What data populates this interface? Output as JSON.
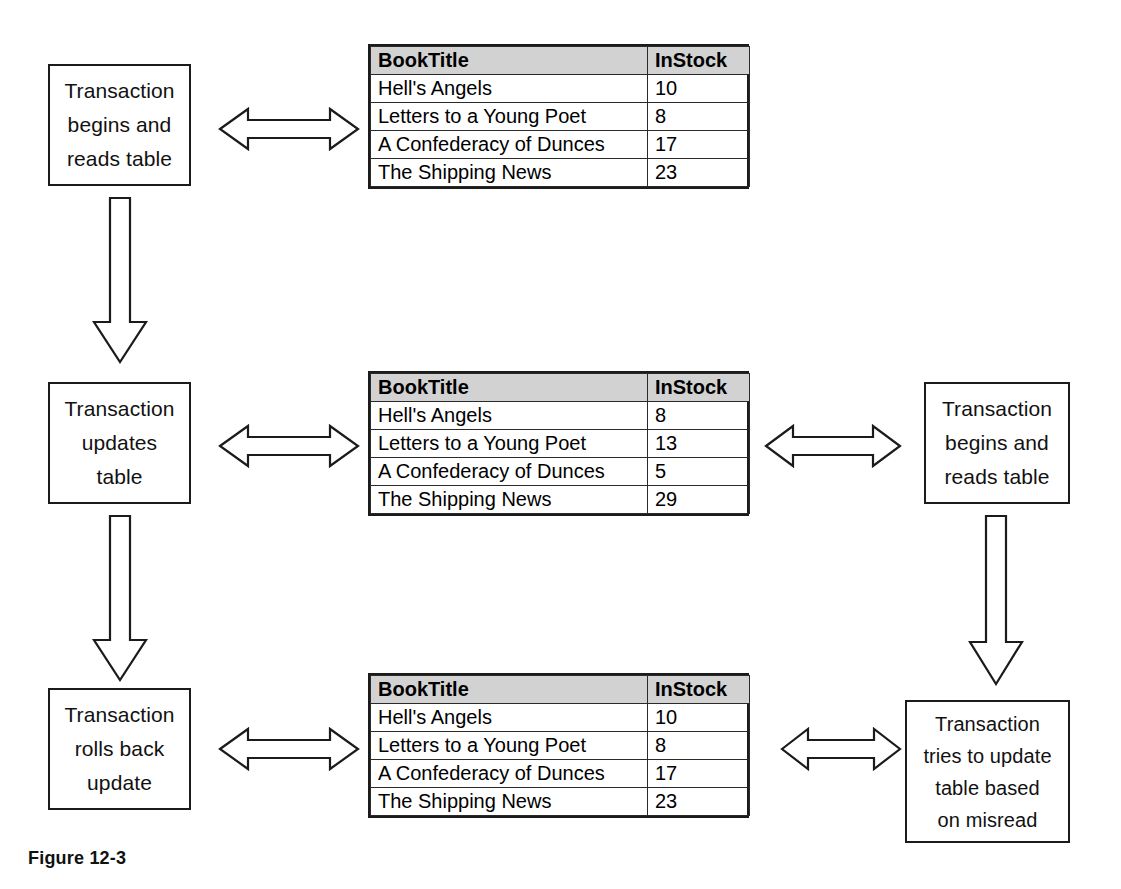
{
  "figure": {
    "caption": "Figure 12-3",
    "table_columns": [
      "BookTitle",
      "InStock"
    ],
    "book_titles": [
      "Hell's Angels",
      "Letters to a Young Poet",
      "A Confederacy of Dunces",
      "The Shipping News"
    ]
  },
  "rows": [
    {
      "id": "row-1",
      "left_box": {
        "lines": [
          "Transaction",
          "begins and",
          "reads table"
        ]
      },
      "table": {
        "columns": [
          "BookTitle",
          "InStock"
        ],
        "rows": [
          {
            "title": "Hell's Angels",
            "instock": "10"
          },
          {
            "title": "Letters to a Young Poet",
            "instock": "8"
          },
          {
            "title": "A Confederacy of Dunces",
            "instock": "17"
          },
          {
            "title": "The Shipping News",
            "instock": "23"
          }
        ]
      },
      "right_box": null
    },
    {
      "id": "row-2",
      "left_box": {
        "lines": [
          "Transaction",
          "updates",
          "table"
        ]
      },
      "table": {
        "columns": [
          "BookTitle",
          "InStock"
        ],
        "rows": [
          {
            "title": "Hell's Angels",
            "instock": "8"
          },
          {
            "title": "Letters to a Young Poet",
            "instock": "13"
          },
          {
            "title": "A Confederacy of Dunces",
            "instock": "5"
          },
          {
            "title": "The Shipping News",
            "instock": "29"
          }
        ]
      },
      "right_box": {
        "lines": [
          "Transaction",
          "begins and",
          "reads table"
        ]
      }
    },
    {
      "id": "row-3",
      "left_box": {
        "lines": [
          "Transaction",
          "rolls back",
          "update"
        ]
      },
      "table": {
        "columns": [
          "BookTitle",
          "InStock"
        ],
        "rows": [
          {
            "title": "Hell's Angels",
            "instock": "10"
          },
          {
            "title": "Letters to a Young Poet",
            "instock": "8"
          },
          {
            "title": "A Confederacy of Dunces",
            "instock": "17"
          },
          {
            "title": "The Shipping News",
            "instock": "23"
          }
        ]
      },
      "right_box": {
        "lines": [
          "Transaction",
          "tries to update",
          "table based",
          "on misread"
        ]
      }
    }
  ],
  "connectors": {
    "horizontal": [
      "double-headed-arrow",
      "double-headed-arrow",
      "double-headed-arrow",
      "double-headed-arrow",
      "double-headed-arrow"
    ],
    "vertical": [
      "down-arrow",
      "down-arrow",
      "down-arrow"
    ]
  },
  "colors": {
    "stroke": "#1b1b1b",
    "header_fill": "#d2d2d2",
    "background": "#ffffff"
  }
}
